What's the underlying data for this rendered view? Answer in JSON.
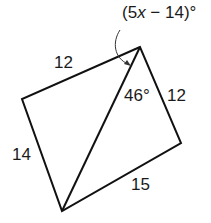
{
  "diagram": {
    "type": "quadrilateral-with-diagonal",
    "stroke_color": "#111111",
    "vertices": {
      "top": [
        140,
        47
      ],
      "left": [
        22,
        99
      ],
      "bottom": [
        62,
        211
      ],
      "right": [
        181,
        143
      ]
    },
    "labels": {
      "side_top_left": "12",
      "side_left_bottom": "14",
      "side_top_right": "12",
      "side_bottom_right": "15",
      "angle_46": "46°",
      "angle_expr_prefix": "(5",
      "angle_expr_var": "x",
      "angle_expr_suffix": " − 14)°"
    }
  }
}
